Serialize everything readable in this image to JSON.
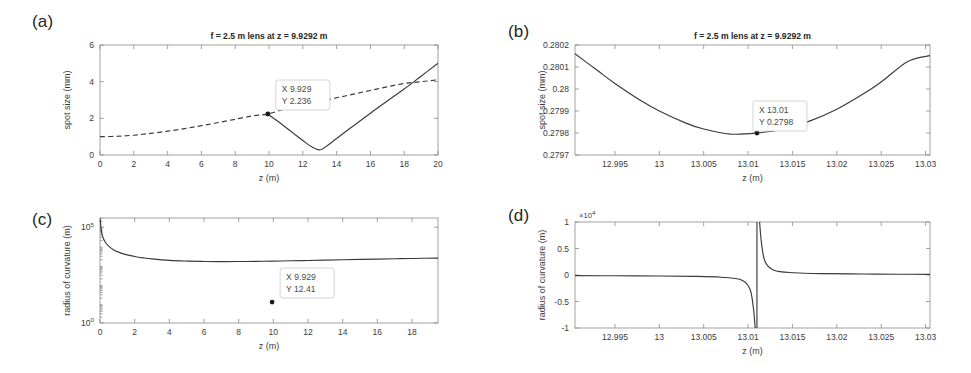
{
  "figure": {
    "background": "#ffffff",
    "curve_color": "#3a3a3a",
    "axis_color": "#8a8a8a",
    "marker_color": "#1a1a1a",
    "tip_border_color": "#c9c9c9"
  },
  "panels": {
    "a": {
      "tag": "(a)",
      "title": "f = 2.5 m lens at z = 9.9292 m",
      "xlabel": "z (m)",
      "ylabel": "spot size (mm)",
      "datatip": {
        "x_line": "X 9.929",
        "y_line": "Y 2.236"
      }
    },
    "b": {
      "tag": "(b)",
      "title": "f = 2.5 m lens at z = 9.9292 m",
      "xlabel": "z (m)",
      "ylabel": "spot size (mm)",
      "datatip": {
        "x_line": "X 13.01",
        "y_line": "Y 0.2798"
      }
    },
    "c": {
      "tag": "(c)",
      "title": "",
      "xlabel": "z (m)",
      "ylabel": "radius of curvature (m)",
      "datatip": {
        "x_line": "X 9.929",
        "y_line": "Y 12.41"
      }
    },
    "d": {
      "tag": "(d)",
      "title": "",
      "xlabel": "z (m)",
      "ylabel": "radius of curvature (m)",
      "y_multiplier_base": "×10",
      "y_multiplier_exponent": "4"
    }
  },
  "chart_data": [
    {
      "id": "a",
      "type": "line",
      "title": "f = 2.5 m lens at z = 9.9292 m",
      "xlabel": "z (m)",
      "ylabel": "spot size (mm)",
      "xlim": [
        0,
        20
      ],
      "ylim": [
        0,
        6
      ],
      "xticks": [
        0,
        2,
        4,
        6,
        8,
        10,
        12,
        14,
        16,
        18,
        20
      ],
      "xticklabels": [
        "0",
        "2",
        "4",
        "6",
        "8",
        "10",
        "12",
        "14",
        "16",
        "18",
        "20"
      ],
      "yticks": [
        0,
        2,
        4,
        6
      ],
      "yticklabels": [
        "0",
        "2",
        "4",
        "6"
      ],
      "yscale": "linear",
      "grid": false,
      "legend": null,
      "series": [
        {
          "name": "free-space beam (no lens)",
          "style": "dashed",
          "x": [
            0,
            1,
            2,
            3,
            4,
            5,
            6,
            7,
            8,
            9,
            9.9292,
            11,
            12,
            13,
            14,
            15,
            16,
            17,
            18,
            19,
            20
          ],
          "y": [
            1.0,
            1.02,
            1.08,
            1.18,
            1.3,
            1.44,
            1.6,
            1.77,
            1.95,
            2.13,
            2.236,
            2.52,
            2.72,
            2.92,
            3.12,
            3.32,
            3.52,
            3.72,
            3.9,
            4.0,
            4.1
          ]
        },
        {
          "name": "beam after f = 2.5 m lens",
          "style": "solid",
          "x": [
            9.9292,
            10.5,
            11,
            11.5,
            12,
            12.5,
            13.011,
            13.5,
            14,
            15,
            16,
            17,
            18,
            19,
            20
          ],
          "y": [
            2.236,
            1.85,
            1.5,
            1.14,
            0.79,
            0.46,
            0.2798,
            0.55,
            0.9,
            1.6,
            2.28,
            2.95,
            3.6,
            4.3,
            5.0
          ]
        }
      ],
      "annotations": [
        {
          "type": "datatip",
          "x": 9.929,
          "y": 2.236,
          "text": [
            "X 9.929",
            "Y 2.236"
          ]
        }
      ]
    },
    {
      "id": "b",
      "type": "line",
      "title": "f = 2.5 m lens at z = 9.9292 m",
      "xlabel": "z (m)",
      "ylabel": "spot size (mm)",
      "xlim": [
        12.9905,
        13.0305
      ],
      "ylim": [
        0.2797,
        0.2802
      ],
      "xticks": [
        12.995,
        13,
        13.005,
        13.01,
        13.015,
        13.02,
        13.025,
        13.03
      ],
      "xticklabels": [
        "12.995",
        "13",
        "13.005",
        "13.01",
        "13.015",
        "13.02",
        "13.025",
        "13.03"
      ],
      "yticks": [
        0.2797,
        0.2798,
        0.2799,
        0.28,
        0.2801,
        0.2802
      ],
      "yticklabels": [
        "0.2797",
        "0.2798",
        "0.2799",
        "0.28",
        "0.2801",
        "0.2802"
      ],
      "yscale": "linear",
      "grid": false,
      "legend": null,
      "series": [
        {
          "name": "spot size near waist",
          "style": "solid",
          "x": [
            12.9905,
            12.993,
            12.995,
            12.998,
            13.0,
            13.003,
            13.005,
            13.008,
            13.011,
            13.014,
            13.017,
            13.02,
            13.023,
            13.025,
            13.028,
            13.0305
          ],
          "y": [
            0.28016,
            0.280085,
            0.280025,
            0.279945,
            0.2799,
            0.279845,
            0.279818,
            0.279795,
            0.2798,
            0.279818,
            0.279855,
            0.279908,
            0.279978,
            0.280032,
            0.280125,
            0.280152
          ]
        }
      ],
      "annotations": [
        {
          "type": "datatip",
          "x": 13.011,
          "y": 0.2798,
          "text": [
            "X 13.01",
            "Y 0.2798"
          ]
        }
      ]
    },
    {
      "id": "c",
      "type": "line",
      "title": "",
      "xlabel": "z (m)",
      "ylabel": "radius of curvature (m)",
      "xlim": [
        0,
        19.5
      ],
      "ylim": [
        1,
        300000
      ],
      "xticks": [
        0,
        2,
        4,
        6,
        8,
        10,
        12,
        14,
        16,
        18
      ],
      "xticklabels": [
        "0",
        "2",
        "4",
        "6",
        "8",
        "10",
        "12",
        "14",
        "16",
        "18"
      ],
      "yticks": [
        1,
        100000
      ],
      "yticklabels": [
        "10",
        "10"
      ],
      "ytickexponents": [
        "0",
        "5"
      ],
      "yscale": "log",
      "grid": false,
      "legend": null,
      "series": [
        {
          "name": "radius of curvature R(z)",
          "style": "solid",
          "x": [
            0.02,
            0.05,
            0.1,
            0.2,
            0.35,
            0.5,
            0.75,
            1.0,
            1.5,
            2.0,
            2.5,
            3.0,
            4.0,
            5.0,
            6.0,
            7.0,
            8.0,
            9.0,
            9.929,
            11.0,
            12.0,
            13.0,
            14.0,
            15.0,
            16.0,
            17.0,
            18.0,
            19.5
          ],
          "y": [
            250000,
            100000,
            50000,
            25000,
            14500,
            10200,
            6900,
            5300,
            3700,
            2950,
            2500,
            2200,
            1850,
            1700,
            1620,
            1600,
            1610,
            1640,
            1680,
            1760,
            1830,
            1910,
            1990,
            2070,
            2160,
            2240,
            2320,
            2440
          ]
        }
      ],
      "annotations": [
        {
          "type": "datatip",
          "x": 9.929,
          "y": 12.41,
          "text": [
            "X 9.929",
            "Y 12.41"
          ]
        }
      ]
    },
    {
      "id": "d",
      "type": "line",
      "title": "",
      "xlabel": "z (m)",
      "ylabel": "radius of curvature (m)",
      "xlim": [
        12.9905,
        13.0305
      ],
      "ylim": [
        -10000,
        10000
      ],
      "y_multiplier": 10000,
      "xticks": [
        12.995,
        13,
        13.005,
        13.01,
        13.015,
        13.02,
        13.025,
        13.03
      ],
      "xticklabels": [
        "12.995",
        "13",
        "13.005",
        "13.01",
        "13.015",
        "13.02",
        "13.025",
        "13.03"
      ],
      "yticks": [
        -10000,
        -5000,
        0,
        5000,
        10000
      ],
      "yticklabels": [
        "-1",
        "-0.5",
        "0",
        "0.5",
        "1"
      ],
      "yscale": "linear",
      "grid": false,
      "legend": null,
      "asymptote_x": 13.011,
      "series": [
        {
          "name": "radius of curvature R(z) left branch",
          "style": "solid",
          "x": [
            12.9905,
            12.995,
            13.0,
            13.004,
            13.007,
            13.0092,
            13.0102,
            13.0106,
            13.0108
          ],
          "y": [
            -120,
            -145,
            -185,
            -250,
            -420,
            -900,
            -2600,
            -6200,
            -10000
          ]
        },
        {
          "name": "radius of curvature R(z) right branch",
          "style": "solid",
          "x": [
            13.0113,
            13.0115,
            13.0119,
            13.0129,
            13.0152,
            13.019,
            13.023,
            13.027,
            13.0305
          ],
          "y": [
            10000,
            6200,
            2600,
            900,
            420,
            250,
            185,
            150,
            125
          ]
        }
      ],
      "annotations": []
    }
  ]
}
